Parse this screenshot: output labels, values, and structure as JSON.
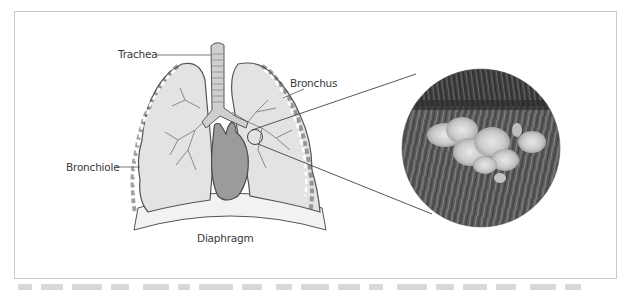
{
  "figure": {
    "type": "anatomical-diagram",
    "labels": {
      "trachea": "Trachea",
      "bronchus": "Bronchus",
      "bronchiole": "Bronchiole",
      "diaphragm": "Diaphragm"
    },
    "magnified_inset": {
      "shape": "circle",
      "content": "micrograph of bronchiole surface with particle cluster"
    },
    "colors": {
      "frame_border": "#c9c9c9",
      "lung_fill": "#e3e3e3",
      "outline": "#555555",
      "heart_fill": "#9b9b9b",
      "label_text": "#3a3a3a",
      "callout_line": "#444444"
    }
  }
}
